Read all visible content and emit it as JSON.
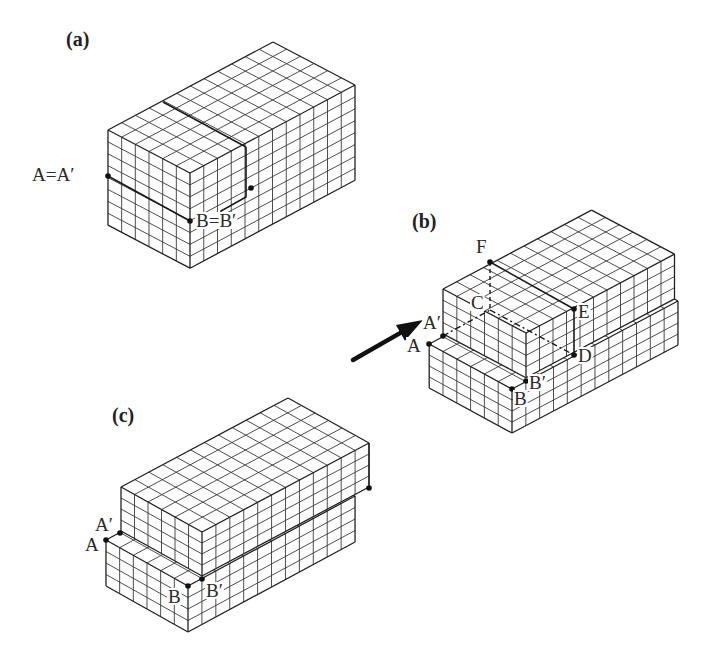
{
  "figure": {
    "panels": [
      {
        "id": "a",
        "label": "(a)",
        "x": 38,
        "y": 46
      },
      {
        "id": "b",
        "label": "(b)",
        "x": 384,
        "y": 228
      },
      {
        "id": "c",
        "label": "(c)",
        "x": 84,
        "y": 422
      }
    ],
    "point_labels": {
      "a": [
        {
          "text": "A=A′",
          "x": 32,
          "y": 181
        },
        {
          "text": "B=B′",
          "x": 196,
          "y": 227
        }
      ],
      "b": [
        {
          "text": "F",
          "x": 476,
          "y": 253
        },
        {
          "text": "C",
          "x": 471,
          "y": 309
        },
        {
          "text": "E",
          "x": 578,
          "y": 318
        },
        {
          "text": "A′",
          "x": 423,
          "y": 329
        },
        {
          "text": "A",
          "x": 407,
          "y": 352
        },
        {
          "text": "D",
          "x": 578,
          "y": 362
        },
        {
          "text": "B′",
          "x": 529,
          "y": 389
        },
        {
          "text": "B",
          "x": 514,
          "y": 405
        }
      ],
      "c": [
        {
          "text": "A′",
          "x": 95,
          "y": 531
        },
        {
          "text": "A",
          "x": 85,
          "y": 551
        },
        {
          "text": "B",
          "x": 168,
          "y": 603
        },
        {
          "text": "B′",
          "x": 206,
          "y": 597
        }
      ]
    },
    "arrow": {
      "from": [
        353,
        360
      ],
      "to": [
        423,
        320
      ],
      "color": "#111111"
    },
    "stroke_color": "#2a2a2a"
  },
  "blocks": {
    "a": {
      "origin": [
        190,
        173
      ],
      "u": [
        -13.67,
        -7.17
      ],
      "v": [
        13.75,
        -7.33
      ],
      "h": 11.9,
      "nu": 6,
      "nv": 12,
      "nh": 8
    },
    "b_lower": {
      "origin": [
        512,
        389
      ],
      "u": [
        -13.8,
        -7.5
      ],
      "v": [
        13.83,
        -7.33
      ],
      "h": 11.0,
      "nu": 6,
      "nv": 12,
      "nh": 4
    },
    "b_upper": {
      "origin": [
        526,
        333
      ],
      "u": [
        -13.83,
        -7.33
      ],
      "v": [
        13.5,
        -7.17
      ],
      "h": 11.2,
      "nu": 6,
      "nv": 11,
      "nh": 4
    },
    "c_lower": {
      "origin": [
        188,
        586
      ],
      "u": [
        -13.67,
        -7.67
      ],
      "v": [
        13.92,
        -7.5
      ],
      "h": 11.5,
      "nu": 6,
      "nv": 12,
      "nh": 4
    },
    "c_upper": {
      "origin": [
        202,
        532
      ],
      "u": [
        -13.5,
        -7.5
      ],
      "v": [
        13.92,
        -7.42
      ],
      "h": 11.0,
      "nu": 6,
      "nv": 12,
      "nh": 4
    }
  },
  "points": {
    "a": [
      [
        108,
        176
      ],
      [
        190,
        221
      ],
      [
        251,
        188
      ]
    ],
    "b": [
      [
        490,
        262
      ],
      [
        574,
        309
      ],
      [
        574,
        355
      ],
      [
        443,
        336
      ],
      [
        429,
        344
      ],
      [
        526,
        381
      ],
      [
        512,
        389
      ]
    ],
    "c": [
      [
        120,
        533
      ],
      [
        106,
        540
      ],
      [
        202,
        579
      ],
      [
        188,
        586
      ],
      [
        369,
        488
      ]
    ]
  },
  "special_lines": {
    "a_step": [
      [
        246,
        147
      ],
      [
        246,
        197
      ],
      [
        221,
        211
      ],
      [
        221,
        215
      ]
    ],
    "a_topdiv": [
      [
        163,
        102
      ],
      [
        246,
        147
      ]
    ],
    "a_burgers": [
      [
        108,
        176
      ],
      [
        190,
        221
      ]
    ],
    "b_dash_FC": [
      [
        490,
        262
      ],
      [
        490,
        310
      ]
    ],
    "b_dashdot_CD": [
      [
        490,
        310
      ],
      [
        574,
        355
      ]
    ],
    "b_dashdot_AC": [
      [
        443,
        336
      ],
      [
        490,
        310
      ]
    ],
    "b_solid_FE": [
      [
        490,
        262
      ],
      [
        574,
        309
      ]
    ],
    "b_solid_ED": [
      [
        574,
        309
      ],
      [
        574,
        355
      ]
    ],
    "c_right_edge": [
      [
        369,
        443
      ],
      [
        369,
        488
      ]
    ]
  }
}
